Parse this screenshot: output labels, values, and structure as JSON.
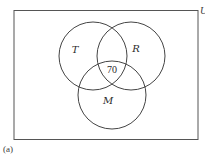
{
  "diagram": {
    "type": "venn",
    "universe": {
      "label": "U",
      "rect": {
        "x": 14,
        "y": 10,
        "width": 184,
        "height": 129
      }
    },
    "sets": [
      {
        "name": "T",
        "cx": 93,
        "cy": 56,
        "r": 34,
        "label_x": 75,
        "label_y": 53
      },
      {
        "name": "R",
        "cx": 131,
        "cy": 56,
        "r": 34,
        "label_x": 136,
        "label_y": 52
      },
      {
        "name": "M",
        "cx": 112,
        "cy": 95,
        "r": 34,
        "label_x": 108,
        "label_y": 104
      }
    ],
    "regions": [
      {
        "region": "T∩R∩M",
        "value": "70",
        "x": 112,
        "y": 72
      }
    ],
    "caption": "(a)",
    "stroke_color": "#444444"
  }
}
